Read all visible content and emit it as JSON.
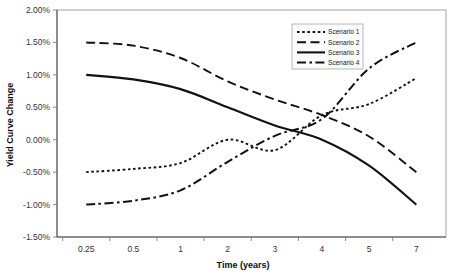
{
  "chart_data": {
    "type": "line",
    "title": "",
    "xlabel": "Time (years)",
    "ylabel": "Yield Curve Change",
    "categories": [
      "0.25",
      "0.5",
      "1",
      "2",
      "3",
      "4",
      "5",
      "7"
    ],
    "x": [
      0.25,
      0.5,
      1,
      2,
      3,
      4,
      5,
      7
    ],
    "ylim": [
      -1.5,
      2.0
    ],
    "ytick_values": [
      2.0,
      1.5,
      1.0,
      0.5,
      0.0,
      -0.5,
      -1.0,
      -1.5
    ],
    "ytick_labels": [
      "2.00%",
      "1.50%",
      "1.00%",
      "0.50%",
      "0.00%",
      "-0.50%",
      "-1.00%",
      "-1.50%"
    ],
    "grid": false,
    "legend_position": "top-right",
    "series": [
      {
        "name": "Scenario 1",
        "style": "dotted",
        "dasharray": "2.6,2.6",
        "width": 1.9,
        "values": [
          -0.5,
          -0.45,
          -0.36,
          0.0,
          -0.16,
          0.38,
          0.55,
          0.95
        ]
      },
      {
        "name": "Scenario 2",
        "style": "dashed",
        "dasharray": "9,4.5",
        "width": 1.9,
        "values": [
          1.5,
          1.45,
          1.26,
          0.9,
          0.62,
          0.38,
          0.05,
          -0.5
        ]
      },
      {
        "name": "Scenario 3",
        "style": "solid",
        "dasharray": "none",
        "width": 2.1,
        "values": [
          1.0,
          0.93,
          0.78,
          0.5,
          0.22,
          0.0,
          -0.4,
          -1.0
        ]
      },
      {
        "name": "Scenario 4",
        "style": "dash-dot",
        "dasharray": "9,3.4,2.6,3.4",
        "width": 2.0,
        "values": [
          -1.0,
          -0.94,
          -0.78,
          -0.34,
          0.06,
          0.32,
          1.1,
          1.5
        ]
      }
    ]
  },
  "colors": {
    "series": "#111111",
    "axis": "#4a4a4a",
    "background": "#ffffff",
    "text": "#222222"
  }
}
